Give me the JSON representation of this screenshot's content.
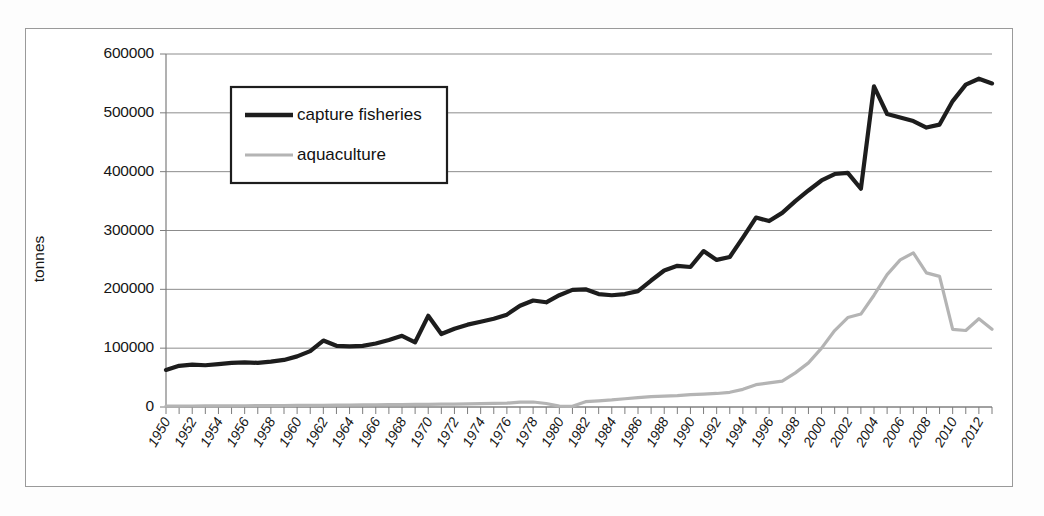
{
  "figure": {
    "background_color": "#ffffff",
    "frame_color": "#9a9a9a"
  },
  "chart_data": {
    "type": "line",
    "title": "",
    "xlabel": "",
    "ylabel": "tonnes",
    "ylim": [
      0,
      600000
    ],
    "xlim": [
      1950,
      2013
    ],
    "grid": true,
    "legend_position": "top-left-inside",
    "ytick_labels": [
      "0",
      "100000",
      "200000",
      "300000",
      "400000",
      "500000",
      "600000"
    ],
    "ytick_values": [
      0,
      100000,
      200000,
      300000,
      400000,
      500000,
      600000
    ],
    "xtick_labels": [
      "1950",
      "1952",
      "1954",
      "1956",
      "1958",
      "1960",
      "1962",
      "1964",
      "1966",
      "1968",
      "1970",
      "1972",
      "1974",
      "1976",
      "1978",
      "1980",
      "1982",
      "1984",
      "1986",
      "1988",
      "1990",
      "1992",
      "1994",
      "1996",
      "1998",
      "2000",
      "2002",
      "2004",
      "2006",
      "2008",
      "2010",
      "2012"
    ],
    "xtick_values": [
      1950,
      1952,
      1954,
      1956,
      1958,
      1960,
      1962,
      1964,
      1966,
      1968,
      1970,
      1972,
      1974,
      1976,
      1978,
      1980,
      1982,
      1984,
      1986,
      1988,
      1990,
      1992,
      1994,
      1996,
      1998,
      2000,
      2002,
      2004,
      2006,
      2008,
      2010,
      2012
    ],
    "x": [
      1950,
      1951,
      1952,
      1953,
      1954,
      1955,
      1956,
      1957,
      1958,
      1959,
      1960,
      1961,
      1962,
      1963,
      1964,
      1965,
      1966,
      1967,
      1968,
      1969,
      1970,
      1971,
      1972,
      1973,
      1974,
      1975,
      1976,
      1977,
      1978,
      1979,
      1980,
      1981,
      1982,
      1983,
      1984,
      1985,
      1986,
      1987,
      1988,
      1989,
      1990,
      1991,
      1992,
      1993,
      1994,
      1995,
      1996,
      1997,
      1998,
      1999,
      2000,
      2001,
      2002,
      2003,
      2004,
      2005,
      2006,
      2007,
      2008,
      2009,
      2010,
      2011,
      2012,
      2013
    ],
    "series": [
      {
        "name": "capture fisheries",
        "color": "#1d1d1d",
        "line_width": 4.2,
        "values": [
          63000,
          70000,
          72000,
          71000,
          73000,
          75000,
          76000,
          75000,
          77000,
          80000,
          86000,
          95000,
          113000,
          104000,
          103000,
          104000,
          108000,
          114000,
          121000,
          110000,
          155000,
          124000,
          133000,
          140000,
          145000,
          150000,
          157000,
          172000,
          181000,
          178000,
          190000,
          199000,
          200000,
          192000,
          190000,
          192000,
          197000,
          215000,
          232000,
          240000,
          238000,
          265000,
          250000,
          255000,
          288000,
          322000,
          316000,
          330000,
          350000,
          368000,
          385000,
          396000,
          398000,
          371000,
          545000,
          498000,
          492000,
          486000,
          475000,
          480000,
          520000,
          548000,
          558000,
          550000
        ]
      },
      {
        "name": "aquaculture",
        "color": "#b4b4b4",
        "line_width": 3.2,
        "values": [
          1500,
          1600,
          1700,
          1800,
          1900,
          2000,
          2100,
          2200,
          2300,
          2500,
          2600,
          2800,
          3000,
          3200,
          3400,
          3600,
          3800,
          4000,
          4200,
          4400,
          4600,
          4800,
          5000,
          5400,
          5800,
          6200,
          6600,
          8200,
          8500,
          6000,
          1500,
          1200,
          9000,
          10500,
          12000,
          14000,
          16000,
          17500,
          18500,
          19500,
          21000,
          22000,
          23000,
          25000,
          30000,
          38000,
          41000,
          44000,
          58000,
          75000,
          100000,
          130000,
          152000,
          158000,
          190000,
          225000,
          250000,
          262000,
          228000,
          222000,
          132000,
          130000,
          150000,
          132000
        ]
      }
    ]
  },
  "legend": {
    "items": [
      {
        "label": "capture fisheries",
        "icon": "thick-dark-line-icon"
      },
      {
        "label": "aquaculture",
        "icon": "thin-gray-line-icon"
      }
    ]
  }
}
